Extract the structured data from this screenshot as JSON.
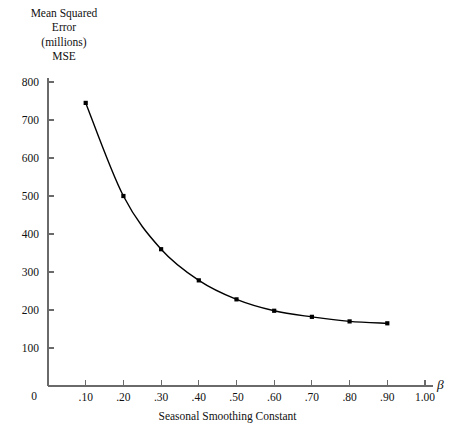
{
  "chart_data": {
    "type": "line",
    "title": "",
    "ylabel_lines": [
      "Mean Squared",
      "Error",
      "(millions)",
      "MSE"
    ],
    "xlabel": "Seasonal Smoothing Constant",
    "x_axis_symbol": "β",
    "x": [
      0.1,
      0.2,
      0.3,
      0.4,
      0.5,
      0.6,
      0.7,
      0.8,
      0.9
    ],
    "values": [
      745,
      500,
      360,
      278,
      228,
      198,
      182,
      170,
      165
    ],
    "xticks": [
      0,
      0.1,
      0.2,
      0.3,
      0.4,
      0.5,
      0.6,
      0.7,
      0.8,
      0.9,
      1.0
    ],
    "xticklabels": [
      "0",
      ".10",
      ".20",
      ".30",
      ".40",
      ".50",
      ".60",
      ".70",
      ".80",
      ".90",
      "1.00"
    ],
    "yticks": [
      0,
      100,
      200,
      300,
      400,
      500,
      600,
      700,
      800
    ],
    "yticklabels": [
      "0",
      "100",
      "200",
      "300",
      "400",
      "500",
      "600",
      "700",
      "800"
    ],
    "xlim": [
      0,
      1.0
    ],
    "ylim": [
      0,
      800
    ],
    "grid": false,
    "legend": null,
    "marker": "square-dot",
    "line_color": "#000000",
    "marker_color": "#000000",
    "axis_color": "#6a6a6a"
  },
  "labels": {
    "y_title_line_1": "Mean Squared",
    "y_title_line_2": "Error",
    "y_title_line_3": "(millions)",
    "y_title_line_4": "MSE",
    "x_caption": "Seasonal Smoothing Constant",
    "beta": "β"
  }
}
